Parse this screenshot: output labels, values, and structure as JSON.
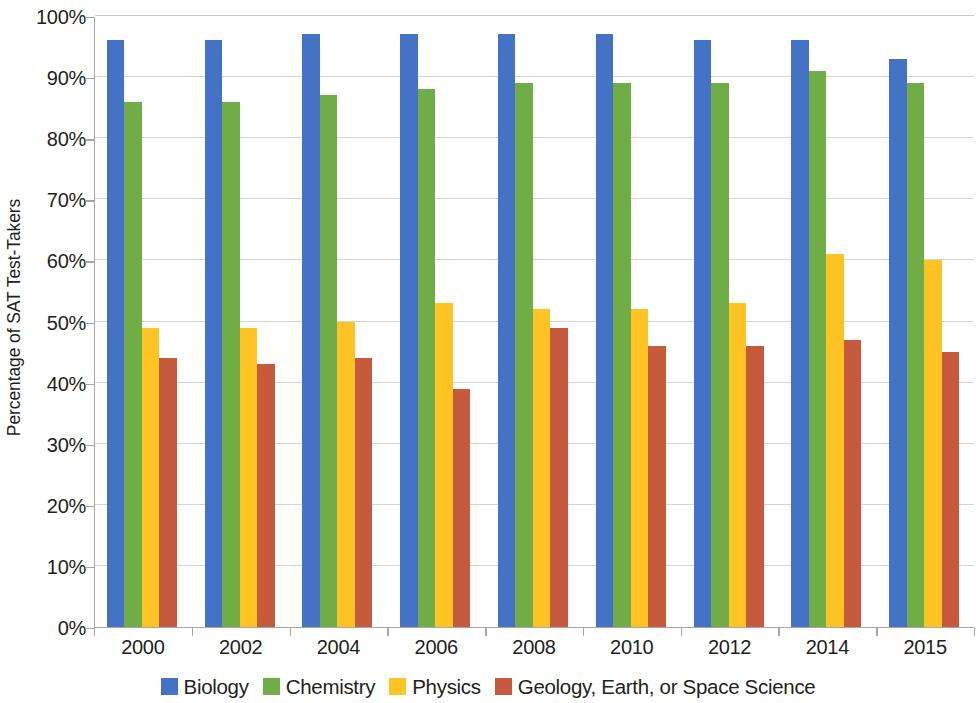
{
  "chart_data": {
    "type": "bar",
    "title": "",
    "subtitle": "",
    "xlabel": "",
    "ylabel": "Percentage of SAT Test-Takers",
    "categories": [
      "2000",
      "2002",
      "2004",
      "2006",
      "2008",
      "2010",
      "2012",
      "2014",
      "2015"
    ],
    "ylim": [
      0,
      100
    ],
    "y_ticks": [
      0,
      10,
      20,
      30,
      40,
      50,
      60,
      70,
      80,
      90,
      100
    ],
    "y_tick_labels": [
      "0%",
      "10%",
      "20%",
      "30%",
      "40%",
      "50%",
      "60%",
      "70%",
      "80%",
      "90%",
      "100%"
    ],
    "grid": true,
    "grid_axis": "y",
    "legend_position": "bottom",
    "value_suffix": "%",
    "series": [
      {
        "name": "Biology",
        "color": "#4472C4",
        "values": [
          96,
          96,
          97,
          97,
          97,
          97,
          96,
          96,
          93
        ]
      },
      {
        "name": "Chemistry",
        "color": "#70AD47",
        "values": [
          86,
          86,
          87,
          88,
          89,
          89,
          89,
          91,
          89
        ]
      },
      {
        "name": "Physics",
        "color": "#FFC424",
        "values": [
          49,
          49,
          50,
          53,
          52,
          52,
          53,
          61,
          60
        ]
      },
      {
        "name": "Geology, Earth, or Space Science",
        "color": "#C55A3C",
        "values": [
          44,
          43,
          44,
          39,
          49,
          46,
          46,
          47,
          45
        ]
      }
    ]
  },
  "axis": {
    "y_title": "Percentage of SAT Test-Takers",
    "axis_line_color": "#a6a6a6",
    "gridline_color": "#d4d4d4",
    "text_color": "#231f20"
  }
}
